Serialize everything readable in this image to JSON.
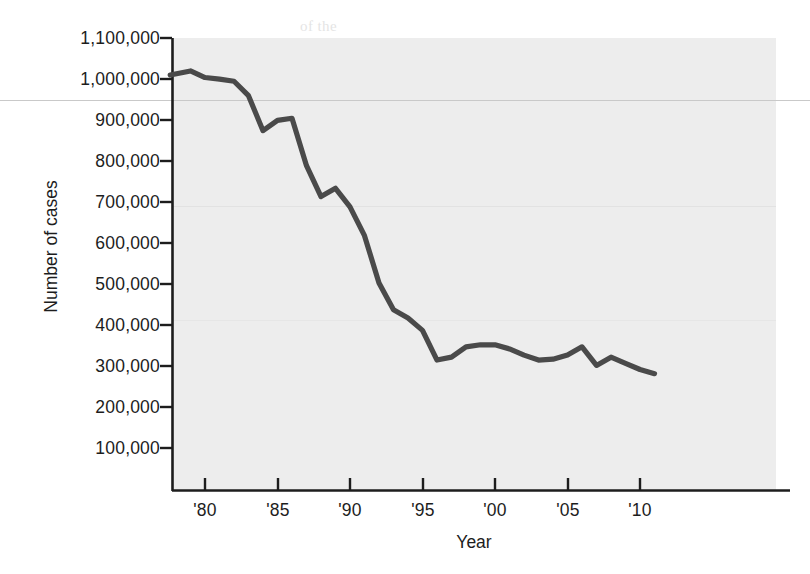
{
  "axes": {
    "y_title": "Number of cases",
    "x_title": "Year",
    "y_tick_labels": [
      "1,100,000",
      "1,000,000",
      "900,000",
      "800,000",
      "700,000",
      "600,000",
      "500,000",
      "400,000",
      "300,000",
      "200,000",
      "100,000"
    ],
    "x_tick_labels": [
      "'80",
      "'85",
      "'90",
      "'95",
      "'00",
      "'05",
      "'10"
    ]
  },
  "style": {
    "plot_background": "#ededed",
    "line_color": "#4a4a4a",
    "axis_color": "#1d1d1d",
    "page_background": "#ffffff"
  },
  "bleed_text": {
    "line1": "of the",
    "line2": "in 1967. CDC",
    "line3": "reported",
    "line4": "the",
    "line5": "1960s",
    "line6": "by 1970,",
    "line7": "in 1984. The",
    "line8": "number of cases",
    "line9": "in the",
    "line10": "reported cases",
    "line11": "surveillance",
    "line12": "to report",
    "line13": "in 1980",
    "line14": "cases"
  },
  "chart_data": {
    "type": "line",
    "title": "",
    "xlabel": "Year",
    "ylabel": "Number of cases",
    "xlim": [
      1977.6,
      2011.5
    ],
    "ylim": [
      0,
      1100000
    ],
    "grid": false,
    "legend": "none",
    "y_ticks": [
      100000,
      200000,
      300000,
      400000,
      500000,
      600000,
      700000,
      800000,
      900000,
      1000000,
      1100000
    ],
    "x_ticks": [
      1980,
      1985,
      1990,
      1995,
      2000,
      2005,
      2010
    ],
    "series": [
      {
        "name": "Number of cases",
        "x": [
          1977.6,
          1979,
          1980,
          1981,
          1982,
          1983,
          1984,
          1985,
          1986,
          1987,
          1988,
          1989,
          1990,
          1991,
          1992,
          1993,
          1994,
          1995,
          1996,
          1997,
          1998,
          1999,
          2000,
          2001,
          2002,
          2003,
          2004,
          2005,
          2006,
          2007,
          2008,
          2009,
          2010,
          2011
        ],
        "y": [
          1010000,
          1020000,
          1004000,
          1000000,
          995000,
          960000,
          875000,
          900000,
          905000,
          790000,
          715000,
          735000,
          690000,
          620000,
          505000,
          440000,
          420000,
          390000,
          318000,
          325000,
          350000,
          355000,
          355000,
          345000,
          330000,
          318000,
          320000,
          330000,
          350000,
          305000,
          325000,
          310000,
          295000,
          285000
        ]
      }
    ]
  }
}
